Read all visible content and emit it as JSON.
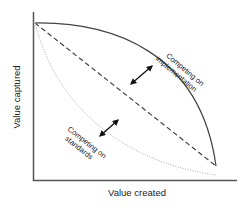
{
  "diagram": {
    "x_axis_label": "Value created",
    "y_axis_label": "Value captured",
    "curves": [
      {
        "name": "Competing on implementation",
        "line1": "Competing on",
        "line2": "implementation",
        "style": "solid",
        "color": "#444444"
      },
      {
        "name": "Baseline",
        "style": "dashed",
        "color": "#444444"
      },
      {
        "name": "Competing on standards",
        "line1": "Competing on",
        "line2": "standards",
        "style": "dotted",
        "color": "#aaaaaa"
      }
    ],
    "arrows": [
      {
        "name": "upper",
        "description": "double-headed arrow between baseline and implementation curve"
      },
      {
        "name": "lower",
        "description": "double-headed arrow between standards curve and baseline"
      }
    ]
  }
}
